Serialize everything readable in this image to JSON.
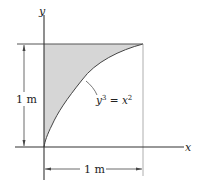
{
  "diagram": {
    "axes": {
      "x_label": "x",
      "y_label": "y"
    },
    "dimensions": {
      "height_label": "1 m",
      "width_label": "1 m"
    },
    "curve": {
      "equation_lhs_base": "y",
      "equation_lhs_exp": "3",
      "equation_eq": " = ",
      "equation_rhs_base": "x",
      "equation_rhs_exp": "2"
    },
    "colors": {
      "shaded_region": "#d6d6d6",
      "lines": "#333333"
    }
  }
}
